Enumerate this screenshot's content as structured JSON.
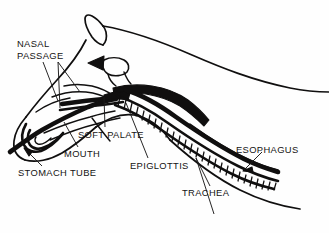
{
  "diagram": {
    "style": "black-and-white line drawing",
    "background_color": "#fefefe",
    "ink_color": "#100f0f",
    "width": 329,
    "height": 233,
    "labels": [
      {
        "id": "nasal-passage",
        "text": "NASAL\nPASSAGE",
        "lines": [
          "NASAL",
          "PASSAGE"
        ],
        "position": {
          "x": 17,
          "y": 38
        },
        "leader": "two lines fanning down-right to the nasal cavity"
      },
      {
        "id": "soft-palate",
        "text": "SOFT PALATE",
        "lines": [
          "SOFT PALATE"
        ],
        "position": {
          "x": 78,
          "y": 129
        },
        "leader": "line up-right to the dark palate band"
      },
      {
        "id": "mouth",
        "text": "MOUTH",
        "lines": [
          "MOUTH"
        ],
        "position": {
          "x": 64,
          "y": 148
        },
        "leader": "line up-left into the oral cavity"
      },
      {
        "id": "stomach-tube",
        "text": "STOMACH TUBE",
        "lines": [
          "STOMACH TUBE"
        ],
        "position": {
          "x": 18,
          "y": 167
        },
        "leader": "arrow up-left to the tube at the nostril"
      },
      {
        "id": "epiglottis",
        "text": "EPIGLOTTIS",
        "lines": [
          "EPIGLOTTIS"
        ],
        "position": {
          "x": 130,
          "y": 160
        },
        "leader": "line up-left to the epiglottis flap"
      },
      {
        "id": "trachea",
        "text": "TRACHEA",
        "lines": [
          "TRACHEA"
        ],
        "position": {
          "x": 182,
          "y": 187
        },
        "leader": "line up-right to the ringed windpipe"
      },
      {
        "id": "esophagus",
        "text": "ESOPHAGUS",
        "lines": [
          "ESOPHAGUS"
        ],
        "position": {
          "x": 236,
          "y": 144
        },
        "leader": "arrow down-left to the esophagus wall"
      }
    ],
    "markers": [
      {
        "id": "airflow-arrow",
        "shape": "solid-triangle",
        "direction": "left",
        "position": {
          "x": 97,
          "y": 63
        }
      }
    ],
    "structures": [
      "head and neck outline",
      "ear",
      "nasal passage",
      "soft palate",
      "oral cavity",
      "epiglottis",
      "trachea with cartilage rings",
      "esophagus",
      "stomach tube"
    ]
  }
}
